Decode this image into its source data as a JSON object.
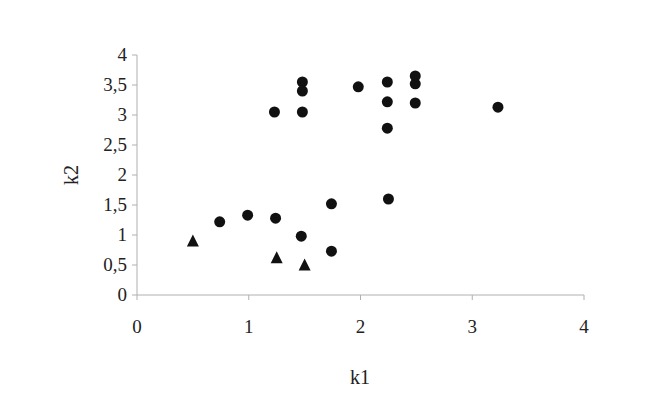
{
  "chart_data": {
    "type": "scatter",
    "title": "",
    "xlabel": "k1",
    "ylabel": "k2",
    "xlim": [
      0,
      4
    ],
    "ylim": [
      0,
      4
    ],
    "x_ticks": [
      0,
      1,
      2,
      3,
      4
    ],
    "x_tick_labels": [
      "0",
      "1",
      "2",
      "3",
      "4"
    ],
    "y_ticks": [
      0,
      0.5,
      1,
      1.5,
      2,
      2.5,
      3,
      3.5,
      4
    ],
    "y_tick_labels": [
      "0",
      "0,5",
      "1",
      "1,5",
      "2",
      "2,5",
      "3",
      "3,5",
      "4"
    ],
    "grid": false,
    "legend": null,
    "series": [
      {
        "name": "circles",
        "marker": "circle",
        "color": "#111111",
        "points": [
          {
            "x": 1.23,
            "y": 3.05
          },
          {
            "x": 1.48,
            "y": 3.55
          },
          {
            "x": 1.48,
            "y": 3.4
          },
          {
            "x": 1.48,
            "y": 3.05
          },
          {
            "x": 1.98,
            "y": 3.47
          },
          {
            "x": 2.24,
            "y": 3.55
          },
          {
            "x": 2.24,
            "y": 3.22
          },
          {
            "x": 2.24,
            "y": 2.78
          },
          {
            "x": 2.49,
            "y": 3.65
          },
          {
            "x": 2.49,
            "y": 3.52
          },
          {
            "x": 2.49,
            "y": 3.2
          },
          {
            "x": 3.23,
            "y": 3.13
          },
          {
            "x": 0.74,
            "y": 1.22
          },
          {
            "x": 0.99,
            "y": 1.33
          },
          {
            "x": 1.24,
            "y": 1.28
          },
          {
            "x": 1.47,
            "y": 0.98
          },
          {
            "x": 1.74,
            "y": 1.52
          },
          {
            "x": 1.74,
            "y": 0.73
          },
          {
            "x": 2.25,
            "y": 1.6
          }
        ]
      },
      {
        "name": "triangles",
        "marker": "triangle",
        "color": "#111111",
        "points": [
          {
            "x": 0.5,
            "y": 0.9
          },
          {
            "x": 1.25,
            "y": 0.62
          },
          {
            "x": 1.5,
            "y": 0.5
          }
        ]
      }
    ]
  },
  "colors": {
    "axis": "#b0b0b0",
    "marker": "#111111",
    "text": "#222222"
  }
}
